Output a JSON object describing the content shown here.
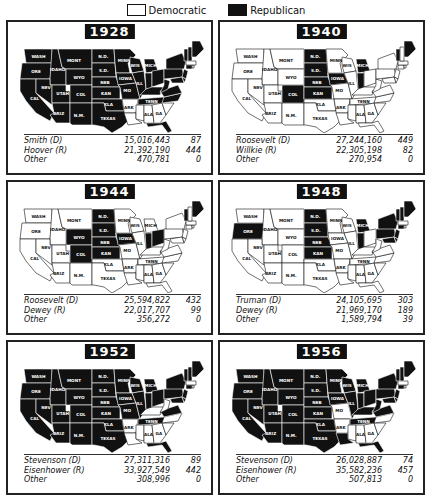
{
  "legend": {
    "democratic": {
      "label": "Democratic",
      "color": "#ffffff"
    },
    "republican": {
      "label": "Republican",
      "color": "#111111"
    }
  },
  "panels": [
    {
      "year": "1928",
      "republican_states": [
        "WASH",
        "ORE",
        "CAL",
        "IDAHO",
        "NEV",
        "MONT",
        "WYO",
        "UTAH",
        "ARIZ",
        "COL",
        "N.M.",
        "N.D.",
        "S.D.",
        "NEB",
        "KAN",
        "OKLA",
        "TEXAS",
        "MINN",
        "IOWA",
        "MO",
        "WIS",
        "ILL",
        "MICH",
        "IND",
        "OHIO",
        "KY",
        "TENN",
        "W.VA",
        "VA",
        "N.C.",
        "PA",
        "N.Y.",
        "N.J.",
        "DEL",
        "MD",
        "CONN",
        "VT",
        "N.H.",
        "ME",
        "FLA"
      ],
      "results": [
        {
          "candidate": "Smith (D)",
          "votes": "15,016,443",
          "ev": "87"
        },
        {
          "candidate": "Hoover (R)",
          "votes": "21,392,190",
          "ev": "444"
        },
        {
          "candidate": "Other",
          "votes": "470,781",
          "ev": "0"
        }
      ]
    },
    {
      "year": "1940",
      "republican_states": [
        "N.D.",
        "S.D.",
        "NEB",
        "KAN",
        "COL",
        "IOWA",
        "MICH",
        "IND",
        "VT",
        "ME"
      ],
      "results": [
        {
          "candidate": "Roosevelt (D)",
          "votes": "27,244,160",
          "ev": "449"
        },
        {
          "candidate": "Willkie (R)",
          "votes": "22,305,198",
          "ev": "82"
        },
        {
          "candidate": "Other",
          "votes": "270,954",
          "ev": "0"
        }
      ]
    },
    {
      "year": "1944",
      "republican_states": [
        "N.D.",
        "S.D.",
        "NEB",
        "KAN",
        "COL",
        "WYO",
        "IOWA",
        "IND",
        "OHIO",
        "VT",
        "ME"
      ],
      "results": [
        {
          "candidate": "Roosevelt (D)",
          "votes": "25,594,822",
          "ev": "432"
        },
        {
          "candidate": "Dewey (R)",
          "votes": "22,017,707",
          "ev": "99"
        },
        {
          "candidate": "Other",
          "votes": "356,272",
          "ev": "0"
        }
      ]
    },
    {
      "year": "1948",
      "republican_states": [
        "ORE",
        "N.D.",
        "S.D.",
        "NEB",
        "KAN",
        "MICH",
        "IND",
        "N.Y.",
        "PA",
        "N.J.",
        "DEL",
        "MD",
        "CONN",
        "VT",
        "N.H.",
        "ME"
      ],
      "results": [
        {
          "candidate": "Truman (D)",
          "votes": "24,105,695",
          "ev": "303"
        },
        {
          "candidate": "Dewey (R)",
          "votes": "21,969,170",
          "ev": "189"
        },
        {
          "candidate": "Other",
          "votes": "1,589,794",
          "ev": "39"
        }
      ]
    },
    {
      "year": "1952",
      "republican_states": [
        "WASH",
        "ORE",
        "CAL",
        "IDAHO",
        "NEV",
        "MONT",
        "WYO",
        "UTAH",
        "ARIZ",
        "COL",
        "N.M.",
        "N.D.",
        "S.D.",
        "NEB",
        "KAN",
        "OKLA",
        "TEXAS",
        "MINN",
        "IOWA",
        "MO",
        "WIS",
        "ILL",
        "MICH",
        "IND",
        "OHIO",
        "TENN",
        "VA",
        "PA",
        "N.Y.",
        "N.J.",
        "DEL",
        "MD",
        "CONN",
        "VT",
        "N.H.",
        "ME",
        "FLA"
      ],
      "results": [
        {
          "candidate": "Stevenson (D)",
          "votes": "27,311,316",
          "ev": "89"
        },
        {
          "candidate": "Eisenhower (R)",
          "votes": "33,927,549",
          "ev": "442"
        },
        {
          "candidate": "Other",
          "votes": "308,996",
          "ev": "0"
        }
      ]
    },
    {
      "year": "1956",
      "republican_states": [
        "WASH",
        "ORE",
        "CAL",
        "IDAHO",
        "NEV",
        "MONT",
        "WYO",
        "UTAH",
        "ARIZ",
        "COL",
        "N.M.",
        "N.D.",
        "S.D.",
        "NEB",
        "KAN",
        "OKLA",
        "TEXAS",
        "MINN",
        "IOWA",
        "WIS",
        "ILL",
        "MICH",
        "IND",
        "OHIO",
        "KY",
        "TENN",
        "W.VA",
        "VA",
        "LA",
        "PA",
        "N.Y.",
        "N.J.",
        "DEL",
        "MD",
        "CONN",
        "VT",
        "N.H.",
        "ME",
        "FLA"
      ],
      "results": [
        {
          "candidate": "Stevenson (D)",
          "votes": "26,028,887",
          "ev": "74"
        },
        {
          "candidate": "Eisenhower (R)",
          "votes": "35,582,236",
          "ev": "457"
        },
        {
          "candidate": "Other",
          "votes": "507,813",
          "ev": "0"
        }
      ]
    }
  ]
}
